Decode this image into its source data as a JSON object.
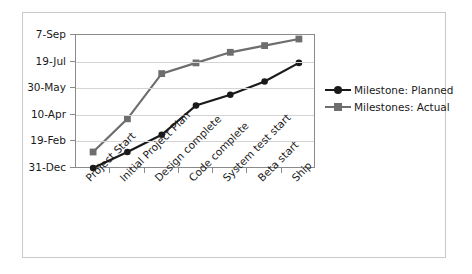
{
  "chart_data": {
    "type": "line",
    "title": "",
    "xlabel": "",
    "ylabel": "",
    "grid": true,
    "legend_position": "right",
    "categories": [
      "Project Start",
      "Initial Project Plan",
      "Design complete",
      "Code complete",
      "System test start",
      "Beta start",
      "Ship"
    ],
    "ytick_labels": [
      "7-Sep",
      "19-Jul",
      "30-May",
      "10-Apr",
      "19-Feb",
      "31-Dec"
    ],
    "ylim_labels": [
      "31-Dec",
      "7-Sep"
    ],
    "series": [
      {
        "name": "Milestone: Planned",
        "color": "#1a1a1a",
        "marker": "circle",
        "values": [
          "31-Dec",
          "5-Feb",
          "6-Mar",
          "20-Apr",
          "8-May",
          "2-Jun",
          "9-Jul"
        ],
        "value_positions": [
          0,
          0.12,
          0.25,
          0.47,
          0.55,
          0.65,
          0.79
        ]
      },
      {
        "name": "Milestones: Actual",
        "color": "#6e6e6e",
        "marker": "square",
        "values": [
          "13-Jan",
          "26-Mar",
          "6-Jun",
          "28-Jun",
          "22-Jul",
          "7-Aug",
          "26-Aug"
        ],
        "value_positions": [
          0.12,
          0.37,
          0.71,
          0.79,
          0.87,
          0.92,
          0.97
        ]
      }
    ]
  },
  "legend": {
    "items": [
      {
        "label": "Milestone: Planned"
      },
      {
        "label": "Milestones: Actual"
      }
    ]
  }
}
